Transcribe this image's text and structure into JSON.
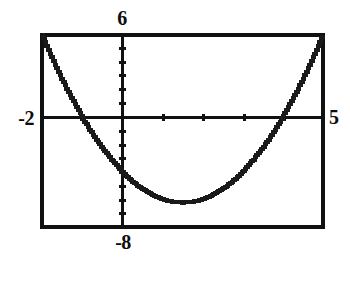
{
  "figure": {
    "kind": "graphing-calculator-window",
    "frame_color": "#111111",
    "curve_color": "#1a1a1a",
    "background": "#ffffff"
  },
  "labels": {
    "ymax": "6",
    "ymin": "-8",
    "xmin": "-2",
    "xmax": "5"
  },
  "chart_data": {
    "type": "line",
    "title": "",
    "subtitle": "",
    "xlabel": "",
    "ylabel": "",
    "grid": false,
    "legend": null,
    "legend_position": "none",
    "xlim": [
      -2,
      5
    ],
    "ylim": [
      -8,
      6
    ],
    "xtick_interval": 1,
    "ytick_interval": 1,
    "xticks": [
      -2,
      -1,
      0,
      1,
      2,
      3,
      4,
      5
    ],
    "yticks": [
      -8,
      -7,
      -6,
      -5,
      -4,
      -3,
      -2,
      -1,
      0,
      1,
      2,
      3,
      4,
      5,
      6
    ],
    "xtick_labels": [
      "-2",
      "",
      "",
      "",
      "",
      "",
      "",
      "5"
    ],
    "ytick_labels": [
      "-8",
      "",
      "",
      "",
      "",
      "",
      "",
      "",
      "",
      "",
      "",
      "",
      "",
      "",
      "6"
    ],
    "axis_labels_shown": [
      "-2",
      "5",
      "6",
      "-8"
    ],
    "series": [
      {
        "name": "y = x^2 - 3x - 4",
        "equation": "y = x^2 - 3x - 4",
        "vertex": [
          1.5,
          -6.25
        ],
        "roots": [
          -1,
          4
        ],
        "y_intercept": -4,
        "x": [
          -2,
          -1.75,
          -1.5,
          -1.25,
          -1,
          -0.75,
          -0.5,
          -0.25,
          0,
          0.25,
          0.5,
          0.75,
          1,
          1.25,
          1.5,
          1.75,
          2,
          2.25,
          2.5,
          2.75,
          3,
          3.25,
          3.5,
          3.75,
          4,
          4.25,
          4.5,
          4.75,
          5
        ],
        "values": [
          6,
          4.3125,
          2.75,
          1.3125,
          0,
          -1.1875,
          -2.25,
          -3.1875,
          -4,
          -4.6875,
          -5.25,
          -5.6875,
          -6,
          -6.1875,
          -6.25,
          -6.1875,
          -6,
          -5.6875,
          -5.25,
          -4.6875,
          -4,
          -3.1875,
          -2.25,
          -1.1875,
          0,
          1.3125,
          2.75,
          4.3125,
          6
        ]
      }
    ]
  }
}
